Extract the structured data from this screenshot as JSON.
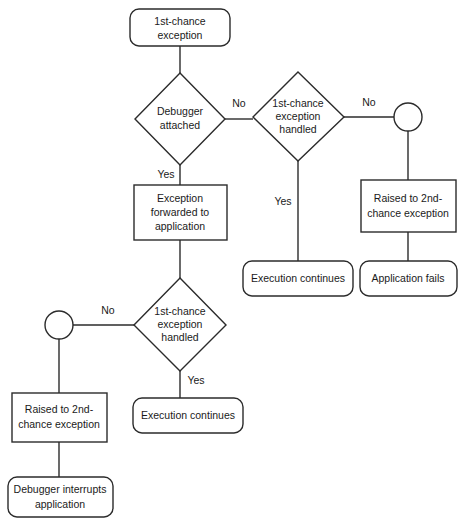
{
  "diagram": {
    "colors": {
      "stroke": "#2b2b2b",
      "fill": "#ffffff",
      "text": "#1a1a1a",
      "background": "#ffffff"
    },
    "nodes": {
      "start": {
        "shape": "rounded-rectangle",
        "line1": "1st-chance",
        "line2": "exception"
      },
      "debugger_attached": {
        "shape": "diamond",
        "line1": "Debugger",
        "line2": "attached"
      },
      "handled_top": {
        "shape": "diamond",
        "line1": "1st-chance",
        "line2": "exception",
        "line3": "handled"
      },
      "connector_top_right": {
        "shape": "circle",
        "label": ""
      },
      "raised_2nd_right": {
        "shape": "rectangle",
        "line1": "Raised to 2nd-",
        "line2": "chance exception"
      },
      "application_fails": {
        "shape": "rounded-rectangle",
        "line1": "Application fails"
      },
      "execution_continues_top": {
        "shape": "rounded-rectangle",
        "line1": "Execution continues"
      },
      "exception_forwarded": {
        "shape": "rectangle",
        "line1": "Exception",
        "line2": "forwarded to",
        "line3": "application"
      },
      "handled_bottom": {
        "shape": "diamond",
        "line1": "1st-chance",
        "line2": "exception",
        "line3": "handled"
      },
      "connector_bottom_left": {
        "shape": "circle",
        "label": ""
      },
      "raised_2nd_left": {
        "shape": "rectangle",
        "line1": "Raised to 2nd-",
        "line2": "chance exception"
      },
      "debugger_interrupts": {
        "shape": "rounded-rectangle",
        "line1": "Debugger interrupts",
        "line2": "application"
      },
      "execution_continues_bottom": {
        "shape": "rounded-rectangle",
        "line1": "Execution continues"
      }
    },
    "edge_labels": {
      "debugger_no": "No",
      "debugger_yes": "Yes",
      "handled_top_no": "No",
      "handled_top_yes": "Yes",
      "handled_bottom_no": "No",
      "handled_bottom_yes": "Yes"
    }
  }
}
